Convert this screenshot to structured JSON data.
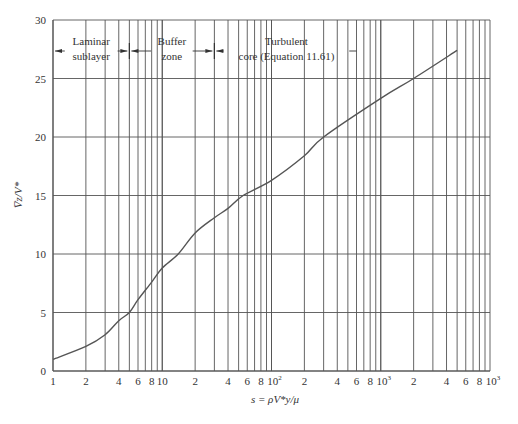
{
  "chart_data": {
    "type": "line",
    "title": "",
    "xlabel": "s = ρV*y/μ",
    "ylabel": "V̅z/V*",
    "xscale": "log",
    "xlim": [
      1,
      10000
    ],
    "ylim": [
      0,
      30
    ],
    "grid": true,
    "legend": "none",
    "y_ticks": [
      0,
      5,
      10,
      15,
      20,
      25,
      30
    ],
    "x_tick_labels": [
      {
        "value": 1,
        "label": "1"
      },
      {
        "value": 2,
        "label": "2"
      },
      {
        "value": 4,
        "label": "4"
      },
      {
        "value": 6,
        "label": "6"
      },
      {
        "value": 8,
        "label": "8"
      },
      {
        "value": 10,
        "label": "10"
      },
      {
        "value": 20,
        "label": "2"
      },
      {
        "value": 40,
        "label": "4"
      },
      {
        "value": 60,
        "label": "6"
      },
      {
        "value": 80,
        "label": "8"
      },
      {
        "value": 100,
        "label": "10",
        "sup": "2"
      },
      {
        "value": 200,
        "label": "2"
      },
      {
        "value": 400,
        "label": "4"
      },
      {
        "value": 600,
        "label": "6"
      },
      {
        "value": 800,
        "label": "8"
      },
      {
        "value": 1000,
        "label": "10",
        "sup": "3"
      },
      {
        "value": 2000,
        "label": "2"
      },
      {
        "value": 4000,
        "label": "4"
      },
      {
        "value": 6000,
        "label": "6"
      },
      {
        "value": 8000,
        "label": "8"
      },
      {
        "value": 10000,
        "label": "10",
        "sup": "3"
      }
    ],
    "series": [
      {
        "name": "Velocity profile",
        "x": [
          1,
          2,
          3,
          4,
          5,
          6,
          8,
          10,
          14,
          20,
          30,
          40,
          55,
          100,
          200,
          300,
          1000,
          2000,
          5000
        ],
        "y": [
          1.0,
          2.1,
          3.1,
          4.3,
          5.0,
          6.1,
          7.6,
          8.8,
          10.0,
          11.8,
          13.1,
          13.9,
          15.0,
          16.3,
          18.4,
          20.0,
          23.3,
          25.0,
          27.4
        ]
      }
    ],
    "annotations": [
      {
        "text_lines": [
          "Laminar",
          "sublayer"
        ],
        "x_from": 1,
        "x_to": 5,
        "arrows": "both"
      },
      {
        "text_lines": [
          "Buffer",
          "zone"
        ],
        "x_from": 5,
        "x_to": 30,
        "arrows": "both"
      },
      {
        "text_lines": [
          "Turbulent",
          "core (Equation 11.61)"
        ],
        "x_from": 30,
        "x_to": 600,
        "arrows": "left"
      }
    ]
  }
}
